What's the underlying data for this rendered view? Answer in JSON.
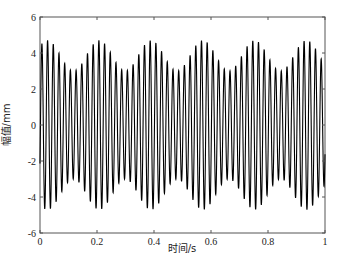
{
  "chart_data": {
    "type": "line",
    "title": "",
    "xlabel": "时间/s",
    "ylabel": "幅值/mm",
    "xlim": [
      0,
      1
    ],
    "ylim": [
      -6,
      6
    ],
    "xticks": [
      0,
      0.2,
      0.4,
      0.6,
      0.8,
      1
    ],
    "xtick_labels": [
      "0",
      "0.2",
      "0.4",
      "0.6",
      "0.8",
      "1"
    ],
    "yticks": [
      -6,
      -4,
      -2,
      0,
      2,
      4,
      6
    ],
    "ytick_labels": [
      "-6",
      "-4",
      "-2",
      "0",
      "2",
      "4",
      "6"
    ],
    "grid": false,
    "legend": null,
    "series": [
      {
        "name": "displacement",
        "color": "#000000",
        "description": "Beating oscillation: ~50 Hz carrier with slowly modulated envelope (~5.5 beats/s); amplitude varies between ~3.0 mm and ~4.7 mm",
        "model": {
          "carrier_hz": 50,
          "beat_hz": 5.5,
          "amp_min": 3.0,
          "amp_max": 4.7,
          "start_value": -2.3
        },
        "sampled_peaks": {
          "t": [
            0.0,
            0.09,
            0.18,
            0.27,
            0.36,
            0.45,
            0.55,
            0.64,
            0.73,
            0.82,
            0.91,
            1.0
          ],
          "envelope": [
            4.4,
            4.7,
            3.1,
            4.7,
            3.0,
            4.6,
            3.0,
            4.6,
            3.2,
            4.7,
            3.2,
            4.5
          ]
        }
      }
    ]
  }
}
